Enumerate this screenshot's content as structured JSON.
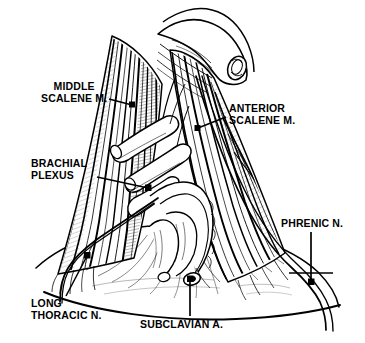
{
  "figure": {
    "style": "black-and-white line engraving",
    "ink_color": "#000000",
    "background_color": "#ffffff",
    "width_px": 365,
    "height_px": 343
  },
  "labels": {
    "middle_scalene": {
      "line1": "MIDDLE",
      "line2": "SCALENE M."
    },
    "anterior_scalene": {
      "line1": "ANTERIOR",
      "line2": "SCALENE M."
    },
    "brachial_plexus": {
      "line1": "BRACHIAL",
      "line2": "PLEXUS"
    },
    "phrenic_nerve": {
      "line1": "PHRENIC N."
    },
    "long_thoracic": {
      "line1": "LONG",
      "line2": "THORACIC N."
    },
    "subclavian_artery": {
      "line1": "SUBCLAVIAN A."
    }
  },
  "structures": [
    {
      "name": "clavicle-cut-end",
      "description": "cut end of clavicle at top right"
    },
    {
      "name": "middle-scalene-muscle",
      "description": "striated muscle belly, left of field"
    },
    {
      "name": "anterior-scalene-muscle",
      "description": "striated muscle belly, right of field"
    },
    {
      "name": "brachial-plexus-trunks",
      "description": "nerve trunks emerging between scalenes"
    },
    {
      "name": "subclavian-artery",
      "description": "vessel passing below plexus over first rib"
    },
    {
      "name": "phrenic-nerve",
      "description": "nerve descending across anterior scalene"
    },
    {
      "name": "long-thoracic-nerve",
      "description": "nerve descending laterally at left"
    },
    {
      "name": "chest-wall-contour",
      "description": "lower body outline sweeping across base"
    }
  ]
}
